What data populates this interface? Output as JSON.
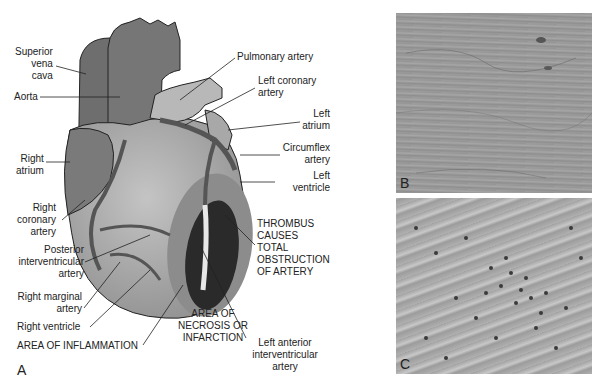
{
  "figure": {
    "panel_a": {
      "letter": "A",
      "labels": {
        "superior_vena_cava": [
          "Superior",
          "vena",
          "cava"
        ],
        "aorta": "Aorta",
        "right_atrium": [
          "Right",
          "atrium"
        ],
        "right_coronary_artery": [
          "Right",
          "coronary",
          "artery"
        ],
        "posterior_interventricular_artery": [
          "Posterior",
          "interventricular",
          "artery"
        ],
        "right_marginal_artery": [
          "Right marginal",
          "artery"
        ],
        "right_ventricle": "Right ventricle",
        "area_of_inflammation": "AREA OF INFLAMMATION",
        "area_of_necrosis": [
          "AREA OF",
          "NECROSIS OR",
          "INFARCTION"
        ],
        "left_anterior_interventricular_artery": [
          "Left anterior",
          "interventricular",
          "artery"
        ],
        "thrombus": [
          "THROMBUS",
          "CAUSES",
          "TOTAL",
          "OBSTRUCTION",
          "OF ARTERY"
        ],
        "left_ventricle": [
          "Left",
          "ventricle"
        ],
        "circumflex_artery": [
          "Circumflex",
          "artery"
        ],
        "left_atrium": [
          "Left",
          "atrium"
        ],
        "left_coronary_artery": [
          "Left coronary",
          "artery"
        ],
        "pulmonary_artery": "Pulmonary artery"
      }
    },
    "panel_b": {
      "letter": "B"
    },
    "panel_c": {
      "letter": "C"
    }
  },
  "colors": {
    "dark_vessel": "#6e6e6e",
    "heart_light": "#b4b4b4",
    "inflammation": "#8c8c8c",
    "necrosis": "#2a2a2a",
    "micrograph_b": "#9a9a9a",
    "micrograph_c": "#a8a8a8"
  }
}
